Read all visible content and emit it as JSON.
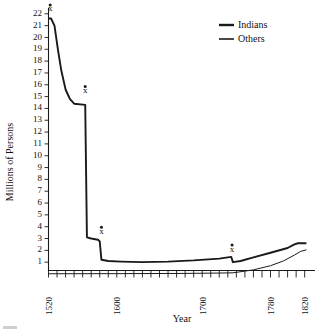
{
  "chart_data": {
    "type": "line",
    "title": "",
    "xlabel": "Year",
    "ylabel": "Millions of Persons",
    "xlim": [
      1520,
      1828
    ],
    "ylim": [
      0,
      22.6
    ],
    "grid": false,
    "legend_position": "top-right",
    "y_ticks": [
      1,
      2,
      3,
      4,
      5,
      6,
      7,
      8,
      9,
      10,
      11,
      12,
      13,
      14,
      15,
      16,
      17,
      18,
      19,
      20,
      21,
      22
    ],
    "x_ticks_labeled": [
      1520,
      1600,
      1700,
      1780,
      1820
    ],
    "x_tick_interval": 10,
    "x_ticks_all": [
      1520,
      1530,
      1540,
      1550,
      1560,
      1570,
      1580,
      1590,
      1600,
      1610,
      1620,
      1630,
      1640,
      1650,
      1660,
      1670,
      1680,
      1690,
      1700,
      1710,
      1720,
      1730,
      1740,
      1750,
      1760,
      1770,
      1780,
      1790,
      1800,
      1810,
      1820
    ],
    "series": [
      {
        "name": "Indians",
        "style": "thick",
        "points": [
          {
            "x": 1520,
            "y": 21.6
          },
          {
            "x": 1523,
            "y": 21.6
          },
          {
            "x": 1527,
            "y": 21.0
          },
          {
            "x": 1531,
            "y": 19.0
          },
          {
            "x": 1535,
            "y": 17.2
          },
          {
            "x": 1540,
            "y": 15.6
          },
          {
            "x": 1545,
            "y": 14.8
          },
          {
            "x": 1550,
            "y": 14.4
          },
          {
            "x": 1563,
            "y": 14.3
          },
          {
            "x": 1565,
            "y": 3.1
          },
          {
            "x": 1570,
            "y": 3.0
          },
          {
            "x": 1578,
            "y": 2.9
          },
          {
            "x": 1580,
            "y": 2.75
          },
          {
            "x": 1582,
            "y": 1.2
          },
          {
            "x": 1590,
            "y": 1.1
          },
          {
            "x": 1605,
            "y": 1.05
          },
          {
            "x": 1630,
            "y": 1.0
          },
          {
            "x": 1660,
            "y": 1.05
          },
          {
            "x": 1690,
            "y": 1.15
          },
          {
            "x": 1720,
            "y": 1.3
          },
          {
            "x": 1734,
            "y": 1.45
          },
          {
            "x": 1736,
            "y": 1.0
          },
          {
            "x": 1745,
            "y": 1.1
          },
          {
            "x": 1760,
            "y": 1.4
          },
          {
            "x": 1780,
            "y": 1.8
          },
          {
            "x": 1800,
            "y": 2.2
          },
          {
            "x": 1808,
            "y": 2.5
          },
          {
            "x": 1812,
            "y": 2.6
          },
          {
            "x": 1822,
            "y": 2.6
          }
        ]
      },
      {
        "name": "Others",
        "style": "thin",
        "points": [
          {
            "x": 1520,
            "y": 0.02
          },
          {
            "x": 1600,
            "y": 0.03
          },
          {
            "x": 1680,
            "y": 0.05
          },
          {
            "x": 1720,
            "y": 0.08
          },
          {
            "x": 1736,
            "y": 0.1
          },
          {
            "x": 1760,
            "y": 0.35
          },
          {
            "x": 1780,
            "y": 0.7
          },
          {
            "x": 1795,
            "y": 1.1
          },
          {
            "x": 1808,
            "y": 1.6
          },
          {
            "x": 1815,
            "y": 1.9
          },
          {
            "x": 1822,
            "y": 2.05
          }
        ]
      }
    ],
    "annotations": [
      {
        "label": "x",
        "x": 1522,
        "y": 22.2,
        "dot": true
      },
      {
        "label": "x",
        "x": 1563,
        "y": 15.3,
        "dot": true
      },
      {
        "label": "x",
        "x": 1582,
        "y": 3.4,
        "dot": true
      },
      {
        "label": "x",
        "x": 1735,
        "y": 1.9,
        "dot": true
      }
    ]
  },
  "legend": {
    "items": [
      {
        "label": "Indians",
        "style": "thick"
      },
      {
        "label": "Others",
        "style": "thin"
      }
    ]
  },
  "axes": {
    "x_title": "Year",
    "y_title": "Millions of Persons"
  }
}
